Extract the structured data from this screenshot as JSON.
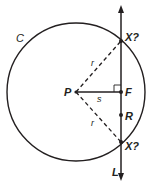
{
  "diagram": {
    "colors": {
      "stroke": "#231f20",
      "background": "#ffffff"
    },
    "circle": {
      "label": "C",
      "cx": 76,
      "cy": 92,
      "r": 69
    },
    "center": {
      "label": "P",
      "x": 76,
      "y": 92
    },
    "line": {
      "label": "L",
      "x": 121,
      "y_top": 8,
      "y_bottom": 178
    },
    "points": {
      "x_top": {
        "label": "X?",
        "x": 121,
        "y": 41
      },
      "x_bottom": {
        "label": "X?",
        "x": 121,
        "y": 142
      },
      "f": {
        "label": "F",
        "x": 121,
        "y": 92
      },
      "r": {
        "label": "R",
        "x": 121,
        "y": 115
      }
    },
    "segments": {
      "radius_top": {
        "label": "r",
        "style": "dashed"
      },
      "radius_bottom": {
        "label": "r",
        "style": "dashed"
      },
      "perpendicular": {
        "label": "s",
        "style": "solid"
      }
    }
  }
}
